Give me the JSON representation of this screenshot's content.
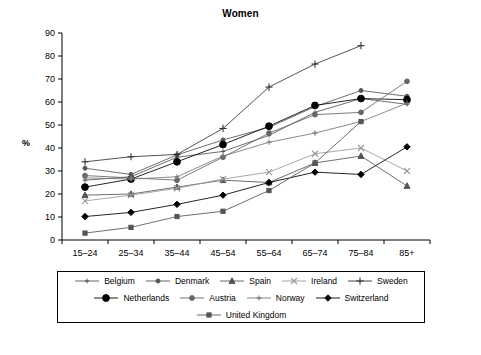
{
  "chart_data": {
    "type": "line",
    "title": "Women",
    "xlabel": "",
    "ylabel": "%",
    "ylim": [
      0,
      90
    ],
    "yticks": [
      0,
      10,
      20,
      30,
      40,
      50,
      60,
      70,
      80,
      90
    ],
    "grid": false,
    "legend_position": "bottom",
    "categories": [
      "15–24",
      "25–34",
      "35–44",
      "45–54",
      "55–64",
      "65–74",
      "75–84",
      "85+"
    ],
    "series": [
      {
        "name": "Belgium",
        "marker": "plus-small",
        "color": "#555555",
        "values": [
          26.0,
          27.5,
          36.0,
          38.5,
          45.5,
          55.5,
          61.5,
          59.0
        ]
      },
      {
        "name": "Denmark",
        "marker": "circle-small",
        "color": "#555555",
        "values": [
          31.2,
          28.5,
          37.0,
          43.5,
          49.0,
          58.0,
          65.0,
          62.5
        ]
      },
      {
        "name": "Spain",
        "marker": "triangle",
        "color": "#555555",
        "values": [
          19.5,
          20.0,
          23.0,
          26.0,
          25.0,
          33.5,
          36.5,
          23.5
        ]
      },
      {
        "name": "Ireland",
        "marker": "cross-x",
        "color": "#999999",
        "values": [
          17.0,
          19.5,
          22.5,
          26.5,
          29.5,
          37.5,
          40.0,
          30.0
        ]
      },
      {
        "name": "Sweden",
        "marker": "plus-large",
        "color": "#333333",
        "values": [
          34.0,
          36.2,
          37.2,
          48.5,
          66.5,
          76.5,
          84.5,
          null
        ]
      },
      {
        "name": "Netherlands",
        "marker": "circle-large",
        "color": "#000000",
        "values": [
          23.0,
          26.5,
          34.0,
          41.5,
          49.5,
          58.5,
          61.5,
          61.0
        ]
      },
      {
        "name": "Austria",
        "marker": "circle-mid",
        "color": "#666666",
        "values": [
          28.0,
          27.0,
          26.0,
          36.0,
          46.5,
          54.5,
          55.5,
          69.0
        ]
      },
      {
        "name": "Norway",
        "marker": "plus-mid",
        "color": "#777777",
        "values": [
          27.0,
          26.5,
          27.5,
          36.5,
          42.5,
          46.5,
          51.5,
          59.5
        ]
      },
      {
        "name": "Switzerland",
        "marker": "diamond",
        "color": "#000000",
        "values": [
          10.2,
          12.0,
          15.5,
          19.5,
          25.0,
          29.5,
          28.5,
          40.5
        ]
      },
      {
        "name": "United Kingdom",
        "marker": "square",
        "color": "#555555",
        "values": [
          3.0,
          5.5,
          10.2,
          12.5,
          21.5,
          33.5,
          51.5,
          null
        ]
      }
    ]
  },
  "legend": {
    "rows": [
      [
        "Belgium",
        "Denmark",
        "Spain",
        "Ireland",
        "Sweden"
      ],
      [
        "Netherlands",
        "Austria",
        "Norway",
        "Switzerland"
      ],
      [
        "United Kingdom"
      ]
    ]
  }
}
